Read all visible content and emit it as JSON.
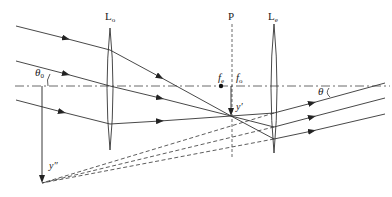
{
  "diagram": {
    "labels": {
      "objective_lens": "L",
      "objective_lens_sub": "o",
      "eyepiece_lens": "L",
      "eyepiece_lens_sub": "e",
      "image_plane": "P",
      "eyepiece_focus": "f",
      "eyepiece_focus_sub": "e",
      "objective_focus": "f",
      "objective_focus_sub": "o",
      "input_angle": "θ",
      "input_angle_sub": "0",
      "output_angle": "θ",
      "intermediate_image": "y′",
      "final_image": "y″"
    },
    "geometry": {
      "optical_axis_y": 86,
      "objective_x": 110,
      "eyepiece_x": 274,
      "image_plane_x": 232,
      "eyepiece_focus_point": [
        221,
        86
      ],
      "intermediate_image_point": [
        231,
        116
      ],
      "final_image_point": [
        42,
        183
      ]
    },
    "colors": {
      "line": "#333333",
      "background": "#ffffff"
    }
  }
}
